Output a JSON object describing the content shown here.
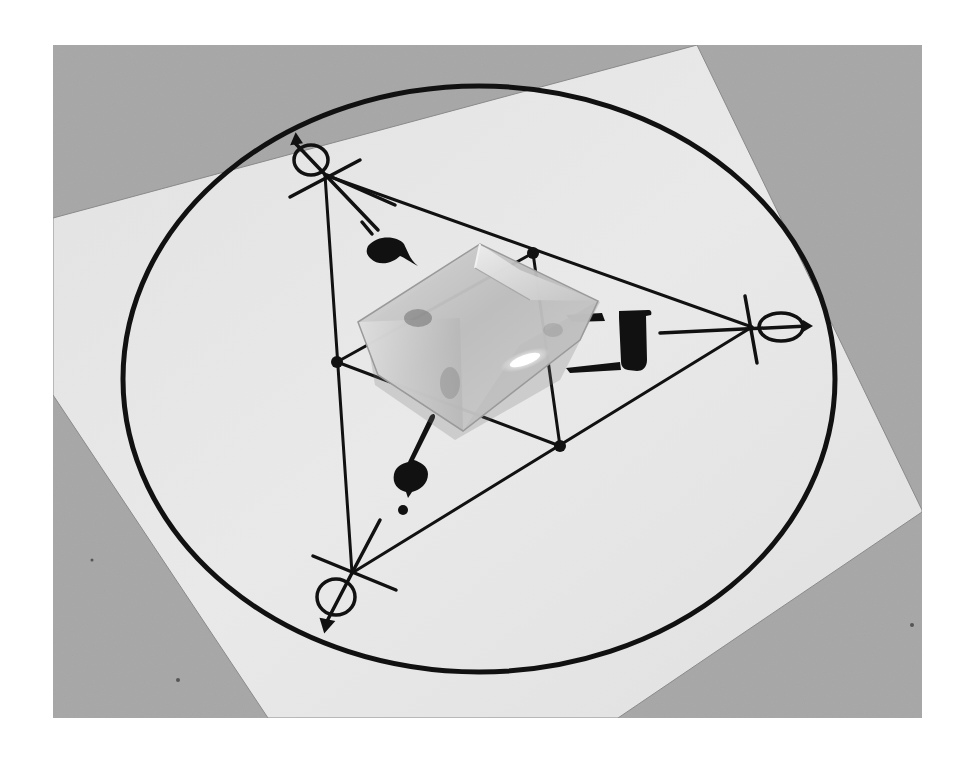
{
  "image": {
    "subject": "Clear faceted crystal resting on a printed sigil diagram",
    "style": "grayscale photograph",
    "colors": {
      "background_surface": "#a9a9a9",
      "paper": "#e4e4e4",
      "ink": "#111111",
      "crystal_body": "#c9c9c9",
      "crystal_highlight": "#f8f8f8",
      "outer_margin": "#ffffff"
    }
  },
  "diagram": {
    "outer_circle": {
      "cx": 479,
      "cy": 379,
      "rx": 356,
      "ry": 293
    },
    "triangle_vertices": [
      {
        "name": "top-left",
        "x": 325,
        "y": 175
      },
      {
        "name": "right",
        "x": 752,
        "y": 327
      },
      {
        "name": "bottom-left",
        "x": 352,
        "y": 573
      }
    ],
    "inner_nodes": [
      {
        "x": 533,
        "y": 253
      },
      {
        "x": 337,
        "y": 362
      },
      {
        "x": 560,
        "y": 446
      }
    ],
    "vertex_symbols": [
      "circle-with-crossed-lines-top-left",
      "circle-with-crossed-lines-right",
      "circle-with-crossed-lines-bottom-left"
    ],
    "glyphs": [
      "teardrop-glyph-upper-left",
      "bracket-glyph-right",
      "comma-glyph-lower-left"
    ]
  },
  "crystal": {
    "shape": "square faceted pyramid",
    "center": {
      "x": 470,
      "y": 335
    }
  }
}
